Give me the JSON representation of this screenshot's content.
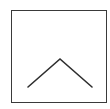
{
  "button": {
    "label": "Scroll up",
    "icon": "chevron-up-icon",
    "border_color": "#3a3a3a",
    "icon_color": "#2e2e2e",
    "background": "#ffffff"
  }
}
